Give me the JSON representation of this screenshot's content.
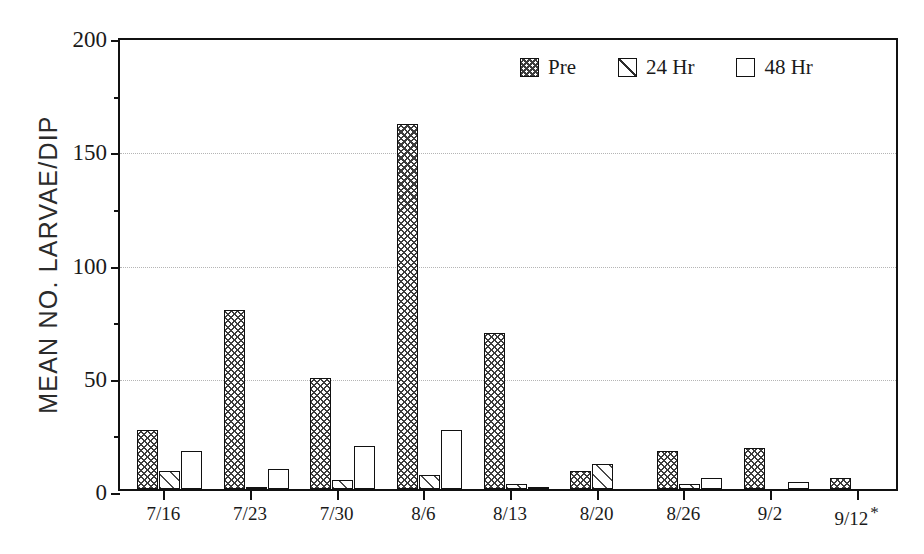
{
  "chart_data": {
    "type": "bar",
    "title": "",
    "xlabel": "",
    "ylabel": "MEAN NO. LARVAE/DIP",
    "ylim": [
      0,
      200
    ],
    "yticks": [
      0,
      50,
      100,
      150,
      200
    ],
    "yticklabels": [
      "0",
      "50",
      "100",
      "150",
      "200"
    ],
    "yminorticks": [
      25,
      75,
      125,
      175
    ],
    "grid": "horizontal-dotted-at-major-ticks",
    "legend_position": "top-right-inside",
    "categories": [
      "7/16",
      "7/23",
      "7/30",
      "8/6",
      "8/13",
      "8/20",
      "8/26",
      "9/2",
      "9/12*"
    ],
    "series": [
      {
        "name": "Pre",
        "pattern": "crosshatch",
        "values": [
          26,
          79,
          49,
          161,
          69,
          8,
          17,
          18,
          5
        ]
      },
      {
        "name": "24 Hr",
        "pattern": "diagonal-hatch",
        "values": [
          8,
          1,
          4,
          6,
          2,
          11,
          2,
          0,
          0
        ]
      },
      {
        "name": "48 Hr",
        "pattern": "empty-white",
        "values": [
          17,
          9,
          19,
          26,
          1,
          0,
          5,
          3,
          0
        ]
      }
    ],
    "annotations": [
      {
        "text": "*",
        "target_category": "9/12",
        "note": "asterisk appended to final x-axis tick label"
      }
    ]
  },
  "axis": {
    "y": {
      "ticks": [
        {
          "value": 200,
          "label": "200"
        },
        {
          "value": 150,
          "label": "150"
        },
        {
          "value": 100,
          "label": "100"
        },
        {
          "value": 50,
          "label": "50"
        },
        {
          "value": 0,
          "label": "0"
        }
      ],
      "minor": [
        175,
        125,
        75,
        25
      ],
      "title": "MEAN NO. LARVAE/DIP"
    },
    "x": {
      "ticks": [
        {
          "label": "7/16",
          "star": ""
        },
        {
          "label": "7/23",
          "star": ""
        },
        {
          "label": "7/30",
          "star": ""
        },
        {
          "label": "8/6",
          "star": ""
        },
        {
          "label": "8/13",
          "star": ""
        },
        {
          "label": "8/20",
          "star": ""
        },
        {
          "label": "8/26",
          "star": ""
        },
        {
          "label": "9/2",
          "star": ""
        },
        {
          "label": "9/12",
          "star": "*"
        }
      ]
    }
  },
  "legend": {
    "items": [
      {
        "label": "Pre",
        "swatch": "crosshatch-swatch"
      },
      {
        "label": "24 Hr",
        "swatch": "diagonal-hatch-swatch"
      },
      {
        "label": "48 Hr",
        "swatch": "empty-swatch"
      }
    ]
  },
  "colors": {
    "axis": "#111111",
    "grid": "#b5b5b5",
    "hatch": "#3d3d3d",
    "background": "#ffffff"
  }
}
